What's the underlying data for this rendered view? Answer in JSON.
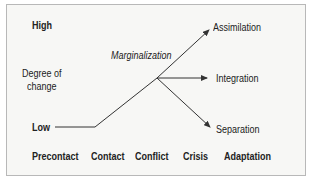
{
  "diagram": {
    "y_axis": {
      "high": "High",
      "label_line1": "Degree of",
      "label_line2": "change",
      "low": "Low"
    },
    "stages": [
      "Precontact",
      "Contact",
      "Conflict",
      "Crisis",
      "Adaptation"
    ],
    "path_label": "Marginalization",
    "outcomes": [
      "Assimilation",
      "Integration",
      "Separation"
    ],
    "colors": {
      "line": "#333333",
      "text": "#222222",
      "border": "#b8b8b8",
      "background": "#f7f7f5"
    }
  }
}
